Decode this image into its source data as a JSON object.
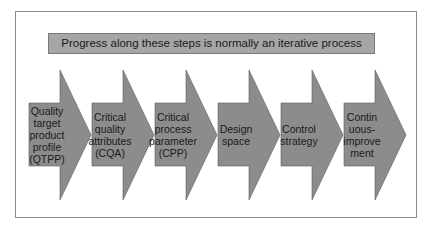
{
  "banner": {
    "text": "Progress along these steps is normally an iterative process"
  },
  "colors": {
    "arrow_fill": "#8c8c8c",
    "arrow_stroke": "#5a5a5a",
    "banner_fill": "#a6a6a6",
    "frame_border": "#8c8c8c"
  },
  "steps": [
    {
      "lines": [
        "Quality",
        "target",
        "product",
        "profile",
        "(QTPP)"
      ]
    },
    {
      "lines": [
        "Critical",
        "quality",
        "attributes",
        "(CQA)"
      ]
    },
    {
      "lines": [
        "Critical",
        "process",
        "parameter",
        "(CPP)"
      ]
    },
    {
      "lines": [
        "Design",
        "space"
      ]
    },
    {
      "lines": [
        "Control",
        "strategy"
      ]
    },
    {
      "lines": [
        "Contin",
        "uous-",
        "improve",
        "ment"
      ]
    }
  ]
}
